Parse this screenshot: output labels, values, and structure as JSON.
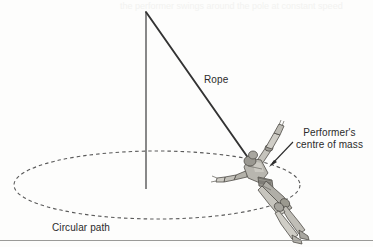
{
  "figure": {
    "background_color": "#fdfdfc",
    "ink_color": "#2b2b2b"
  },
  "labels": {
    "rope": "Rope",
    "com_line1": "Performer's",
    "com_line2": "centre of mass",
    "circular_path": "Circular path"
  },
  "elements": {
    "vertical_axis": {
      "name": "vertical-axis-line",
      "x": 146,
      "y_top": 12,
      "y_bottom": 189,
      "color": "#4a4a4a",
      "width": 1.3
    },
    "rope": {
      "name": "rope-line",
      "x1": 146,
      "y1": 12,
      "x2": 251,
      "y2": 162,
      "color": "#3a3a3a",
      "width": 1.8
    },
    "circular_path": {
      "name": "circular-path-ellipse",
      "cx": 157,
      "cy": 185,
      "rx": 143,
      "ry": 34,
      "color": "#5a5a5a",
      "dash": "3.5 3",
      "width": 1.1
    },
    "com_arrow": {
      "name": "centre-of-mass-arrow",
      "x1": 292,
      "y1": 143,
      "x2": 269,
      "y2": 167,
      "color": "#2b2b2b",
      "width": 1.1
    },
    "performer": {
      "name": "performer-figure",
      "fill_light": "#cfcdc6",
      "fill_mid": "#b3b1a9",
      "fill_dark": "#8e8c85",
      "outline": "#4f4d48"
    },
    "footer_rule": {
      "name": "footer-rule",
      "y": 240,
      "color": "#9a9a98"
    }
  },
  "ghost_text": {
    "top": "the performer swings around the pole at constant speed"
  }
}
